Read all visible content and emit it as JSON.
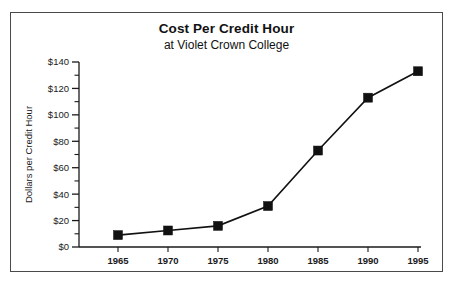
{
  "chart_data": {
    "type": "line",
    "title": "Cost Per Credit Hour",
    "subtitle": "at Violet Crown College",
    "xlabel": "",
    "ylabel": "Dollars per Credit Hour",
    "categories": [
      "1965",
      "1970",
      "1975",
      "1980",
      "1985",
      "1990",
      "1995"
    ],
    "x": [
      1965,
      1970,
      1975,
      1980,
      1985,
      1990,
      1995
    ],
    "values": [
      9,
      12.5,
      16,
      31,
      73,
      113,
      133
    ],
    "series": [
      {
        "name": "Dollars per Credit Hour",
        "values": [
          9,
          12.5,
          16,
          31,
          73,
          113,
          133
        ]
      }
    ],
    "ylim": [
      0,
      140
    ],
    "ytick_values": [
      0,
      20,
      40,
      60,
      80,
      100,
      120,
      140
    ],
    "ytick_labels": [
      "$0",
      "$20",
      "$40",
      "$60",
      "$80",
      "$100",
      "$120",
      "$140"
    ],
    "yminor_step": 10,
    "xtick_labels": [
      "1965",
      "1970",
      "1975",
      "1980",
      "1985",
      "1990",
      "1995"
    ],
    "grid": false,
    "legend": "none",
    "marker": "filled-square",
    "line_color": "#111111",
    "marker_color": "#111111",
    "background_color": "#ffffff",
    "border_color": "#4a4a4a"
  }
}
